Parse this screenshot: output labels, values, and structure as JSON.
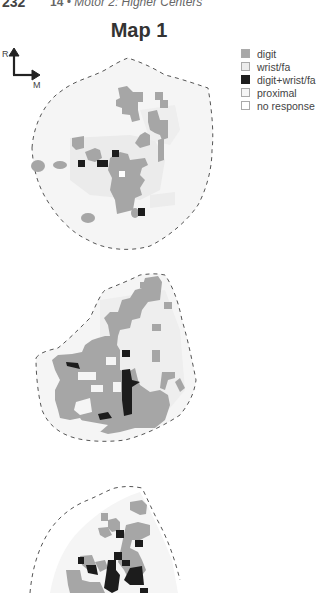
{
  "header": {
    "page_number": "232",
    "chapter_number": "14",
    "separator": "•",
    "chapter_title": "Motor 2: Higher Centers"
  },
  "figure": {
    "title": "Map 1",
    "compass": {
      "up_label": "R",
      "right_label": "M"
    },
    "legend": [
      {
        "label": "digit",
        "color": "#a8a8a8"
      },
      {
        "label": "wrist/fa",
        "color": "#ececec"
      },
      {
        "label": "digit+wrist/fa",
        "color": "#1e1e1e"
      },
      {
        "label": "proximal",
        "color": "#f6f6f6"
      },
      {
        "label": "no response",
        "color": "#ffffff"
      }
    ],
    "colors": {
      "digit": "#a8a8a8",
      "wrist_fa": "#ececec",
      "digit_wrist_fa": "#1e1e1e",
      "proximal": "#f4f4f4",
      "outline": "#555555"
    }
  }
}
